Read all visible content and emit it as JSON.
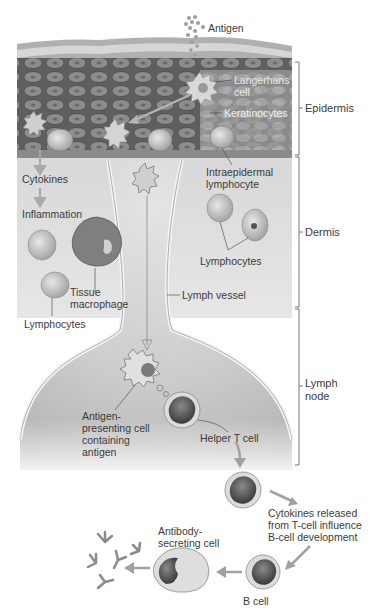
{
  "figure": {
    "colors": {
      "epidermis_dark": "#6d6d6d",
      "epidermis_light": "#a9a9a9",
      "dermis_bg": "#dcdcdc",
      "lymph_node_bg": "#cfcfcf",
      "vessel_wall": "#f2f2f2",
      "arrow": "#9a9a9a",
      "label_text": "#3b3b3b"
    }
  },
  "regions": {
    "epidermis": "Epidermis",
    "dermis": "Dermis",
    "lymph_node": "Lymph\nnode"
  },
  "labels": {
    "antigen": "Antigen",
    "langerhans": "Langerhans\ncell",
    "keratinocytes": "Keratinocytes",
    "cytokines": "Cytokines",
    "inflammation": "Inflammation",
    "intraepidermal": "Intraepidermal\nlymphocyte",
    "lymphocytes_right": "Lymphocytes",
    "tissue_macrophage": "Tissue\nmacrophage",
    "lymph_vessel": "Lymph vessel",
    "lymphocytes_left": "Lymphocytes",
    "apc": "Antigen-\npresenting cell\ncontaining\nantigen",
    "helper_t": "Helper T cell",
    "cytokines_released": "Cytokines released\nfrom T-cell influence\nB-cell development",
    "antibody_secreting": "Antibody-\nsecreting cell",
    "b_cell": "B cell"
  }
}
